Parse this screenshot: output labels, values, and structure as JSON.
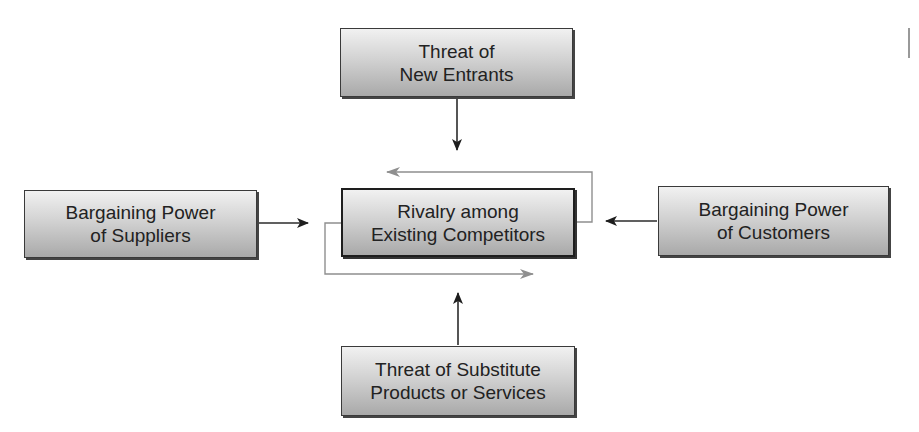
{
  "diagram": {
    "type": "porters-five-forces",
    "nodes": {
      "new_entrants": {
        "line1": "Threat of",
        "line2": "New Entrants"
      },
      "rivalry": {
        "line1": "Rivalry among",
        "line2": "Existing Competitors"
      },
      "suppliers": {
        "line1": "Bargaining Power",
        "line2": "of Suppliers"
      },
      "customers": {
        "line1": "Bargaining Power",
        "line2": "of Customers"
      },
      "substitutes": {
        "line1": "Threat of Substitute",
        "line2": "Products or Services"
      }
    },
    "edges": [
      {
        "from": "new_entrants",
        "to": "rivalry",
        "color": "#2b2b2b"
      },
      {
        "from": "suppliers",
        "to": "rivalry",
        "color": "#2b2b2b"
      },
      {
        "from": "customers",
        "to": "rivalry",
        "color": "#2b2b2b"
      },
      {
        "from": "substitutes",
        "to": "rivalry",
        "color": "#2b2b2b"
      },
      {
        "from": "rivalry",
        "to": "rivalry",
        "kind": "feedback-loop",
        "color": "#8c8c8c"
      }
    ]
  }
}
